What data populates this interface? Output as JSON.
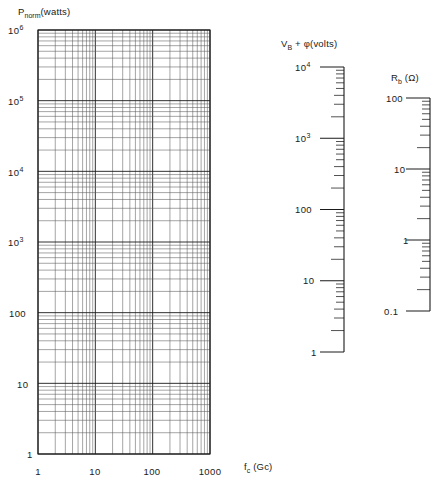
{
  "figure": {
    "kind": "log-log nomograph",
    "background": "#ffffff",
    "line_color": "#1a1a1a",
    "grid_color": "#4a4a4a"
  },
  "main_plot": {
    "y_axis_title": "P",
    "y_axis_title_sub": "norm",
    "y_axis_title_unit": "(watts)",
    "x_axis_title": "f",
    "x_axis_title_sub": "c",
    "x_axis_title_unit": "(Gc)",
    "y_tick_labels": [
      "10",
      "10",
      "10",
      "10",
      "100",
      "10",
      "1"
    ],
    "y_tick_exponents": [
      "6",
      "5",
      "4",
      "3",
      "",
      "",
      ""
    ],
    "x_tick_labels": [
      "1",
      "10",
      "100",
      "1000"
    ]
  },
  "middle_scale": {
    "title_main": "V",
    "title_sub": "B",
    "title_plus": "+",
    "title_phi": "φ",
    "title_unit": "(volts)",
    "tick_labels": [
      "10",
      "10",
      "100",
      "10",
      "1"
    ],
    "tick_exponents": [
      "4",
      "3",
      "",
      "",
      ""
    ]
  },
  "right_scale": {
    "title_main": "R",
    "title_sub": "b",
    "title_unit": "(Ω)",
    "tick_labels": [
      "100",
      "10",
      "1",
      "0.1"
    ]
  },
  "page_artifact": {
    "clipped_text_top": ""
  },
  "chart_data": {
    "type": "line",
    "title": "",
    "subtitle": "",
    "xlabel": "f_c (Gc)",
    "ylabel": "P_norm (watts)",
    "xscale": "log",
    "yscale": "log",
    "xlim": [
      1,
      1000
    ],
    "ylim": [
      1,
      1000000
    ],
    "xtick_values": [
      1,
      10,
      100,
      1000
    ],
    "xtick_labels": [
      "1",
      "10",
      "100",
      "1000"
    ],
    "ytick_values": [
      1,
      10,
      100,
      1000,
      10000,
      100000,
      1000000
    ],
    "ytick_labels": [
      "1",
      "10",
      "100",
      "10^3",
      "10^4",
      "10^5",
      "10^6"
    ],
    "grid": "log-log minor grid on both axes (decade subdivisions 2-9)",
    "legend": "none",
    "series": [],
    "annotations": [],
    "auxiliary_scales": [
      {
        "name": "V_B + φ (volts)",
        "type": "log",
        "orientation": "vertical",
        "lim": [
          1,
          10000
        ],
        "tick_values": [
          1,
          10,
          100,
          1000,
          10000
        ],
        "tick_labels": [
          "1",
          "10",
          "100",
          "10^3",
          "10^4"
        ],
        "minor_ticks": "decade subdivisions 2-9",
        "tick_side": "left"
      },
      {
        "name": "R_b (Ω)",
        "type": "log",
        "orientation": "vertical",
        "lim": [
          0.1,
          100
        ],
        "tick_values": [
          0.1,
          1,
          10,
          100
        ],
        "tick_labels": [
          "0.1",
          "1",
          "10",
          "100"
        ],
        "minor_ticks": "decade subdivisions 2-9",
        "tick_side": "left"
      }
    ]
  }
}
